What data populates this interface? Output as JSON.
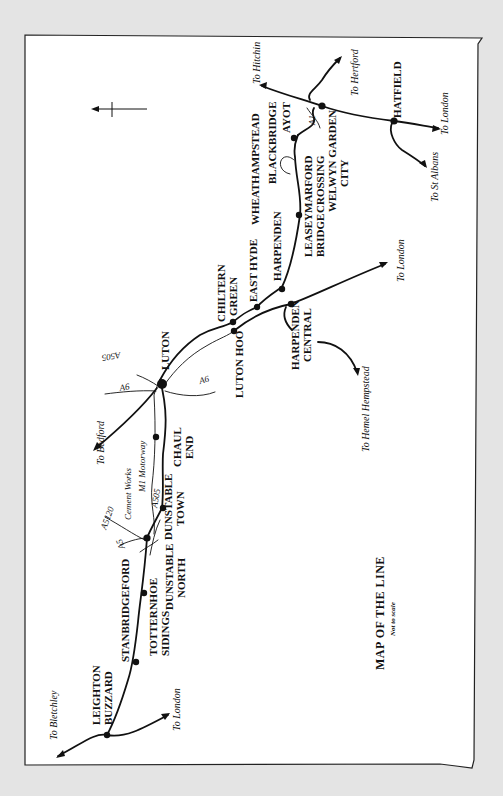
{
  "map": {
    "title": "MAP OF THE LINE",
    "subtitle": "Not to scale",
    "orientation": "rotated 90° counter-clockwise (read with page turned)",
    "colors": {
      "background": "#e4e4e4",
      "paper": "#ffffff",
      "ink": "#111111"
    },
    "stations": [
      {
        "id": "leighton-buzzard",
        "lines": [
          "LEIGHTON",
          "BUZZARD"
        ]
      },
      {
        "id": "stanbridgeford",
        "lines": [
          "STANBRIDGEFORD"
        ]
      },
      {
        "id": "totternhoe-sidings",
        "lines": [
          "TOTTERNHOE",
          "SIDINGS"
        ]
      },
      {
        "id": "dunstable-north",
        "lines": [
          "DUNSTABLE",
          "NORTH"
        ]
      },
      {
        "id": "dunstable-town",
        "lines": [
          "DUNSTABLE",
          "TOWN"
        ]
      },
      {
        "id": "chaul-end",
        "lines": [
          "CHAUL",
          "END"
        ]
      },
      {
        "id": "luton",
        "lines": [
          "LUTON"
        ]
      },
      {
        "id": "luton-hoo",
        "lines": [
          "LUTON HOO"
        ]
      },
      {
        "id": "chiltern-green",
        "lines": [
          "CHILTERN",
          "GREEN"
        ]
      },
      {
        "id": "east-hyde",
        "lines": [
          "EAST HYDE"
        ]
      },
      {
        "id": "harpenden",
        "lines": [
          "HARPENDEN"
        ]
      },
      {
        "id": "harpenden-central",
        "lines": [
          "HARPENDEN",
          "CENTRAL"
        ]
      },
      {
        "id": "leasey-bridge",
        "lines": [
          "LEASEY",
          "BRIDGE"
        ]
      },
      {
        "id": "wheathampstead",
        "lines": [
          "WHEATHAMPSTEAD"
        ]
      },
      {
        "id": "marford-crossing",
        "lines": [
          "MARFORD",
          "CROSSING"
        ]
      },
      {
        "id": "blackbridge",
        "lines": [
          "BLACKBRIDGE"
        ]
      },
      {
        "id": "ayot",
        "lines": [
          "AYOT"
        ]
      },
      {
        "id": "welwyn-garden-city",
        "lines": [
          "WELWYN GARDEN",
          "CITY"
        ]
      },
      {
        "id": "hatfield",
        "lines": [
          "HATFIELD"
        ]
      }
    ],
    "destinations": {
      "bletchley": "To Bletchley",
      "london_lb": "To London",
      "bedford": "To Bedford",
      "hemel": "To Hemel Hempstead",
      "london_hc": "To London",
      "hitchin": "To Hitchin",
      "hertford": "To Hertford",
      "london_hat": "To London",
      "st_albans": "To St Albans"
    },
    "annotations": {
      "cement_works": "Cement Works",
      "m1": "M1 Motorway",
      "a5": "A5",
      "a5120": "A5120",
      "a505_dunstable": "A505",
      "a505_luton": "A505",
      "a6_west": "A6",
      "a6_east": "A6",
      "a1": "A1"
    }
  }
}
